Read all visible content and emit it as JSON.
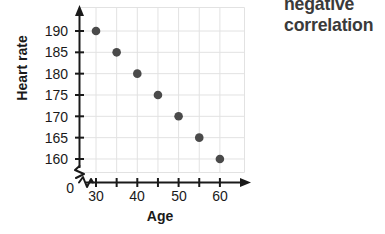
{
  "annotation": {
    "line1": "negative",
    "line2": "correlation"
  },
  "axes": {
    "x_title": "Age",
    "y_title": "Heart rate",
    "origin_label": "0",
    "x_ticks": [
      "30",
      "40",
      "50",
      "60"
    ],
    "y_ticks": [
      "190",
      "185",
      "180",
      "175",
      "170",
      "165",
      "160"
    ],
    "x_break_icon": "axis-break-zigzag",
    "y_break_icon": "axis-break-zigzag",
    "x_arrow_icon": "arrow-right-icon",
    "y_arrow_icon": "arrow-up-icon"
  },
  "colors": {
    "point": "#4a4a4a",
    "axis": "#1a1a1a",
    "grid": "#e2e2e2",
    "text": "#1a1a1a",
    "annotation": "#3a3a3a",
    "background": "#ffffff"
  },
  "chart_data": {
    "type": "scatter",
    "title": "negative correlation",
    "xlabel": "Age",
    "ylabel": "Heart rate",
    "xlim": [
      27.5,
      63.5
    ],
    "ylim": [
      157.5,
      192.5
    ],
    "x": [
      30,
      35,
      40,
      45,
      50,
      55,
      60
    ],
    "y": [
      190,
      185,
      180,
      175,
      170,
      165,
      160
    ],
    "points": [
      {
        "x": 30,
        "y": 190
      },
      {
        "x": 35,
        "y": 185
      },
      {
        "x": 40,
        "y": 180
      },
      {
        "x": 45,
        "y": 175
      },
      {
        "x": 50,
        "y": 170
      },
      {
        "x": 55,
        "y": 165
      },
      {
        "x": 60,
        "y": 160
      }
    ],
    "x_tick_values": [
      30,
      40,
      50,
      60
    ],
    "x_minor_tick_values": [
      35,
      45,
      55
    ],
    "y_tick_values": [
      190,
      185,
      180,
      175,
      170,
      165,
      160
    ],
    "grid": true,
    "legend": null,
    "axis_break": true,
    "correlation": "negative"
  }
}
